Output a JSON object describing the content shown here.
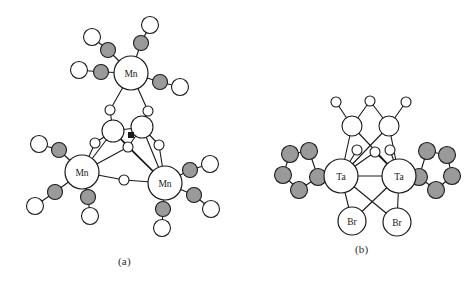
{
  "figure": {
    "background_color": "#ffffff",
    "width": 473,
    "height": 289,
    "panels": [
      {
        "id": "a",
        "caption": "(a)",
        "subject": "Trinuclear manganese carbonyl cluster with bridging oxygen/hydroxo ligands"
      },
      {
        "id": "b",
        "caption": "(b)",
        "subject": "Dinuclear tantalum cluster with bridging bromides, carbonyls and cyclopentadienyl rings"
      }
    ]
  },
  "style": {
    "bond_color": "#1a1a1a",
    "bond_width": 1.1,
    "atom_outline": "#1a1a1a",
    "atom_outline_width": 1.1,
    "carbon_fill": "#9a9a9a",
    "oxygen_fill": "#ffffff",
    "metal_fill": "#ffffff",
    "halide_fill": "#ffffff",
    "label_color": "#1a1a1a"
  },
  "legend_keys": {
    "gray_sphere": "carbon (carbonyl C / cyclopentadienyl C)",
    "white_small_sphere": "oxygen",
    "white_large_labeled_sphere": "metal or halide center"
  },
  "panel_a": {
    "caption": "(a)",
    "metal_label": "Mn",
    "metal_count": 3,
    "metals": [
      {
        "name": "mn-top",
        "label": "Mn",
        "x": 131,
        "y": 73,
        "r": 17
      },
      {
        "name": "mn-left",
        "label": "Mn",
        "x": 82,
        "y": 172,
        "r": 17
      },
      {
        "name": "mn-right",
        "label": "Mn",
        "x": 165,
        "y": 183,
        "r": 17
      }
    ],
    "carbonyls": [
      {
        "metal": "mn-top",
        "c": {
          "x": 108,
          "y": 50
        },
        "o": {
          "x": 92,
          "y": 37
        }
      },
      {
        "metal": "mn-top",
        "c": {
          "x": 141,
          "y": 43
        },
        "o": {
          "x": 150,
          "y": 25
        }
      },
      {
        "metal": "mn-top",
        "c": {
          "x": 101,
          "y": 72
        },
        "o": {
          "x": 79,
          "y": 70
        }
      },
      {
        "metal": "mn-top",
        "c": {
          "x": 160,
          "y": 82
        },
        "o": {
          "x": 180,
          "y": 87
        }
      },
      {
        "metal": "mn-left",
        "c": {
          "x": 59,
          "y": 150
        },
        "o": {
          "x": 39,
          "y": 144
        }
      },
      {
        "metal": "mn-left",
        "c": {
          "x": 55,
          "y": 192
        },
        "o": {
          "x": 35,
          "y": 206
        }
      },
      {
        "metal": "mn-left",
        "c": {
          "x": 88,
          "y": 197
        },
        "o": {
          "x": 90,
          "y": 216
        }
      },
      {
        "metal": "mn-right",
        "c": {
          "x": 190,
          "y": 170
        },
        "o": {
          "x": 210,
          "y": 164
        }
      },
      {
        "metal": "mn-right",
        "c": {
          "x": 194,
          "y": 195
        },
        "o": {
          "x": 211,
          "y": 209
        }
      },
      {
        "metal": "mn-right",
        "c": {
          "x": 163,
          "y": 209
        },
        "o": {
          "x": 162,
          "y": 228
        }
      }
    ],
    "bridge_oxygens": [
      {
        "name": "o-bridge-upper-left",
        "x": 110,
        "y": 110,
        "r": 5
      },
      {
        "name": "o-bridge-upper-right",
        "x": 148,
        "y": 111,
        "r": 5
      },
      {
        "name": "o-bridge-mid-left",
        "x": 95,
        "y": 143,
        "r": 5
      },
      {
        "name": "o-bridge-mid-right",
        "x": 159,
        "y": 145,
        "r": 5
      },
      {
        "name": "o-bridge-center",
        "x": 128,
        "y": 147,
        "r": 5
      },
      {
        "name": "o-bridge-bottom",
        "x": 124,
        "y": 180,
        "r": 5
      }
    ],
    "core_atoms": [
      {
        "name": "core-left",
        "x": 113,
        "y": 131,
        "r": 11
      },
      {
        "name": "core-right",
        "x": 142,
        "y": 127,
        "r": 11
      }
    ],
    "core_marker": {
      "name": "core-marker",
      "x": 131,
      "y": 135,
      "size": 5
    }
  },
  "panel_b": {
    "caption": "(b)",
    "metal_label": "Ta",
    "halide_label": "Br",
    "metals": [
      {
        "name": "ta-left",
        "label": "Ta",
        "x": 341,
        "y": 176,
        "r": 17
      },
      {
        "name": "ta-right",
        "label": "Ta",
        "x": 399,
        "y": 176,
        "r": 17
      }
    ],
    "halides": [
      {
        "name": "br-left",
        "label": "Br",
        "x": 352,
        "y": 221,
        "r": 14
      },
      {
        "name": "br-right",
        "label": "Br",
        "x": 397,
        "y": 222,
        "r": 14
      }
    ],
    "terminal_carbonyls": [
      {
        "name": "co-left",
        "c": {
          "x": 352,
          "y": 126,
          "r": 10
        },
        "o": {
          "x": 336,
          "y": 102,
          "r": 5
        }
      },
      {
        "name": "co-right",
        "c": {
          "x": 389,
          "y": 126,
          "r": 10
        },
        "o": {
          "x": 406,
          "y": 102,
          "r": 5
        }
      }
    ],
    "bridging_carbonyl": {
      "name": "co-bridge",
      "o": {
        "x": 370,
        "y": 101,
        "r": 5
      }
    },
    "lower_oxygens": [
      {
        "name": "o-lower-left",
        "x": 357,
        "y": 150,
        "r": 5
      },
      {
        "name": "o-lower-mid",
        "x": 375,
        "y": 152,
        "r": 5
      },
      {
        "name": "o-lower-right",
        "x": 390,
        "y": 150,
        "r": 5
      }
    ],
    "cp_rings": [
      {
        "name": "cp-ring-left",
        "carbons": [
          {
            "x": 309,
            "y": 151
          },
          {
            "x": 290,
            "y": 154
          },
          {
            "x": 283,
            "y": 175
          },
          {
            "x": 299,
            "y": 190
          },
          {
            "x": 318,
            "y": 177
          }
        ]
      },
      {
        "name": "cp-ring-right",
        "carbons": [
          {
            "x": 427,
            "y": 151
          },
          {
            "x": 447,
            "y": 155
          },
          {
            "x": 452,
            "y": 176
          },
          {
            "x": 436,
            "y": 190
          },
          {
            "x": 419,
            "y": 177
          }
        ]
      }
    ]
  }
}
